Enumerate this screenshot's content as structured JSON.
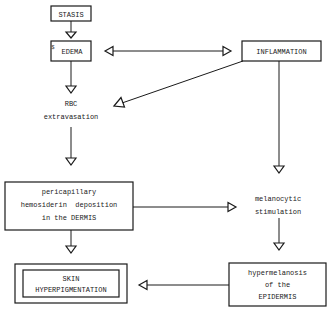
{
  "diagram": {
    "type": "flowchart",
    "nodes": {
      "stasis": {
        "lines": [
          "STASIS"
        ]
      },
      "edema": {
        "marker": "$",
        "lines": [
          "EDEMA"
        ]
      },
      "inflammation": {
        "lines": [
          "INFLAMMATION"
        ]
      },
      "rbc": {
        "lines": [
          "RBC",
          "extravasation"
        ]
      },
      "pericapillary": {
        "lines": [
          "pericapillary",
          "hemosiderin  deposition",
          "in the DERMIS"
        ]
      },
      "melanocytic": {
        "lines": [
          "melanocytic",
          "stimulation"
        ]
      },
      "hypermelanosis": {
        "lines": [
          "hypermelanosis",
          "of the",
          "EPIDERMIS"
        ]
      },
      "skin": {
        "lines": [
          "SKIN",
          "HYPERPIGMENTATION"
        ]
      }
    },
    "edges": [
      {
        "from": "STASIS",
        "to": "EDEMA"
      },
      {
        "from": "EDEMA",
        "to": "INFLAMMATION",
        "bidirectional": true
      },
      {
        "from": "EDEMA",
        "to": "RBC extravasation"
      },
      {
        "from": "INFLAMMATION",
        "to": "RBC extravasation"
      },
      {
        "from": "INFLAMMATION",
        "to": "melanocytic stimulation"
      },
      {
        "from": "RBC extravasation",
        "to": "pericapillary hemosiderin deposition in the DERMIS"
      },
      {
        "from": "pericapillary hemosiderin deposition in the DERMIS",
        "to": "melanocytic stimulation"
      },
      {
        "from": "pericapillary hemosiderin deposition in the DERMIS",
        "to": "SKIN HYPERPIGMENTATION"
      },
      {
        "from": "melanocytic stimulation",
        "to": "hypermelanosis of the EPIDERMIS"
      },
      {
        "from": "hypermelanosis of the EPIDERMIS",
        "to": "SKIN HYPERPIGMENTATION"
      }
    ]
  }
}
